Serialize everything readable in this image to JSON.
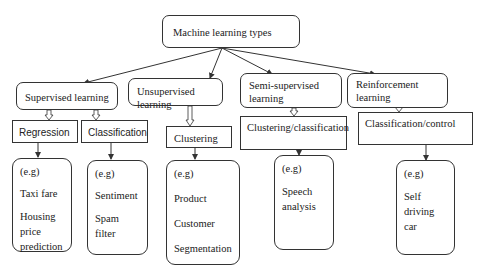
{
  "root": {
    "label": "Machine learning types"
  },
  "categories": [
    {
      "label": "Supervised learning",
      "subtypes": [
        {
          "label": "Regression",
          "examples": {
            "prefix": "(e.g)",
            "items": [
              "Taxi fare",
              "Housing price prediction"
            ]
          }
        },
        {
          "label": "Classification",
          "examples": {
            "prefix": "(e.g)",
            "items": [
              "Sentiment",
              "Spam filter"
            ]
          }
        }
      ]
    },
    {
      "label": "Unsupervised learning",
      "subtypes": [
        {
          "label": "Clustering",
          "examples": {
            "prefix": "(e.g)",
            "items": [
              "Product",
              "Customer",
              "Segmentation"
            ]
          }
        }
      ]
    },
    {
      "label": "Semi-supervised learning",
      "subtypes": [
        {
          "label": "Clustering/classification",
          "examples": {
            "prefix": "(e.g)",
            "items": [
              "Speech analysis"
            ]
          }
        }
      ]
    },
    {
      "label": "Reinforcement learning",
      "subtypes": [
        {
          "label": "Classification/control",
          "examples": {
            "prefix": "(e.g)",
            "items": [
              "Self driving car"
            ]
          }
        }
      ]
    }
  ],
  "colors": {
    "line": "#333333",
    "background": "#ffffff",
    "text": "#222222"
  }
}
